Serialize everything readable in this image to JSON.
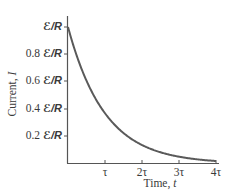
{
  "chart_data": {
    "type": "line",
    "title": "",
    "xlabel": "Time, t",
    "ylabel": "Current, I",
    "x_ticks": [
      "τ",
      "2τ",
      "3τ",
      "4τ"
    ],
    "x_tick_values": [
      1,
      2,
      3,
      4
    ],
    "y_ticks": [
      "0.2 ℰ/R",
      "0.4 ℰ/R",
      "0.6 ℰ/R",
      "0.8 ℰ/R",
      "ℰ/R"
    ],
    "y_tick_values": [
      0.2,
      0.4,
      0.6,
      0.8,
      1.0
    ],
    "xlim": [
      0,
      4
    ],
    "ylim": [
      0,
      1
    ],
    "grid": false,
    "legend": null,
    "series": [
      {
        "name": "I(t) = (ℰ/R) e^(-t/τ)",
        "x": [
          0,
          0.25,
          0.5,
          0.75,
          1,
          1.5,
          2,
          2.5,
          3,
          3.5,
          4
        ],
        "y": [
          1.0,
          0.779,
          0.607,
          0.472,
          0.368,
          0.223,
          0.135,
          0.082,
          0.05,
          0.03,
          0.018
        ],
        "color": "#5a5a5a"
      }
    ]
  },
  "labels": {
    "ylabel_text": "Current, ",
    "ylabel_var": "I",
    "xlabel_text": "Time, ",
    "xlabel_var": "t",
    "yticks": [
      {
        "coef": "",
        "unit": "ℰ/R"
      },
      {
        "coef": "0.8 ",
        "unit": "ℰ/R"
      },
      {
        "coef": "0.6 ",
        "unit": "ℰ/R"
      },
      {
        "coef": "0.4 ",
        "unit": "ℰ/R"
      },
      {
        "coef": "0.2 ",
        "unit": "ℰ/R"
      }
    ],
    "xticks": [
      "τ",
      "2τ",
      "3τ",
      "4τ"
    ]
  },
  "colors": {
    "axis": "#555555",
    "curve": "#5a5a5a",
    "text": "#3a3a3a"
  }
}
